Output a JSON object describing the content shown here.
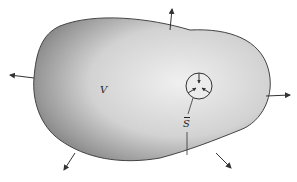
{
  "diagram": {
    "labels": {
      "volume": "V",
      "surface": "S"
    },
    "colors": {
      "body_fill_light": "#e6e6e6",
      "body_fill_dark": "#8a8a8a",
      "outline": "#444444",
      "arrow": "#333333",
      "background": "#ffffff"
    },
    "arrows": [
      {
        "name": "normal-top-left",
        "direction": "up"
      },
      {
        "name": "normal-left",
        "direction": "left"
      },
      {
        "name": "normal-right",
        "direction": "right"
      },
      {
        "name": "normal-bottom-left",
        "direction": "down-left"
      },
      {
        "name": "normal-bottom-right",
        "direction": "down-right"
      }
    ]
  }
}
